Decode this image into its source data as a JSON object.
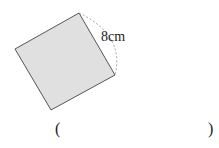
{
  "figure": {
    "shape": "square",
    "side_label": "8cm",
    "fill_color": "#e0e0e0",
    "stroke_color": "#555555"
  },
  "answer": {
    "open_paren": "(",
    "close_paren": ")"
  }
}
